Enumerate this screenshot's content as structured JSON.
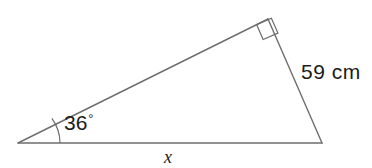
{
  "figure": {
    "stroke_color": "#6e6e6e",
    "text_color": "#1b1b1b",
    "background_color": "#ffffff",
    "stroke_width": 1.4,
    "vertices": {
      "left": {
        "x": 18,
        "y": 143
      },
      "top_right": {
        "x": 268,
        "y": 19
      },
      "bottom_right": {
        "x": 322,
        "y": 143
      }
    },
    "right_angle_marker": {
      "at_vertex": "top_right",
      "size": 15
    },
    "angle_arc": {
      "at_vertex": "left",
      "radius": 42
    }
  },
  "labels": {
    "angle": {
      "value": "36",
      "degree_symbol": "°"
    },
    "side_right": "59 cm",
    "side_base": "x"
  }
}
